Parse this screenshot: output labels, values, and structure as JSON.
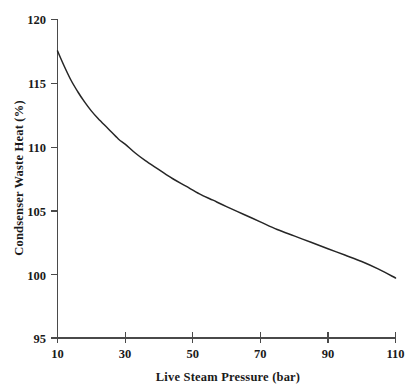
{
  "chart_data": {
    "type": "line",
    "title": "",
    "xlabel": "Live Steam Pressure (bar)",
    "ylabel": "Condsenser Waste Heat (%)",
    "xlim": [
      10,
      110
    ],
    "ylim": [
      95,
      120
    ],
    "xticks": [
      10,
      30,
      50,
      70,
      90,
      110
    ],
    "xtick_labels": [
      "10",
      "30",
      "50",
      "70",
      "90",
      "110"
    ],
    "yticks": [
      95,
      100,
      105,
      110,
      115,
      120
    ],
    "ytick_labels": [
      "95",
      "100",
      "105",
      "110",
      "115",
      "120"
    ],
    "grid": false,
    "legend": null,
    "series": [
      {
        "name": "Condenser waste heat",
        "x": [
          10,
          12,
          14,
          16,
          18,
          20,
          22,
          25,
          28,
          30,
          33,
          36,
          40,
          44,
          48,
          52,
          56,
          60,
          65,
          70,
          75,
          80,
          85,
          90,
          95,
          100,
          105,
          110
        ],
        "values": [
          117.5,
          116.3,
          115.2,
          114.3,
          113.5,
          112.8,
          112.2,
          111.4,
          110.6,
          110.2,
          109.5,
          108.9,
          108.2,
          107.5,
          106.9,
          106.3,
          105.8,
          105.3,
          104.7,
          104.1,
          103.5,
          103.0,
          102.5,
          102.0,
          101.5,
          101.0,
          100.4,
          99.7
        ]
      }
    ],
    "curve_color": "#262626",
    "axis_color": "#4a4a4a",
    "background_color": "#ffffff",
    "text_color": "#1a1a1a"
  },
  "axes": {
    "y_title": "Condsenser Waste Heat (%)",
    "x_title": "Live Steam Pressure (bar)"
  }
}
